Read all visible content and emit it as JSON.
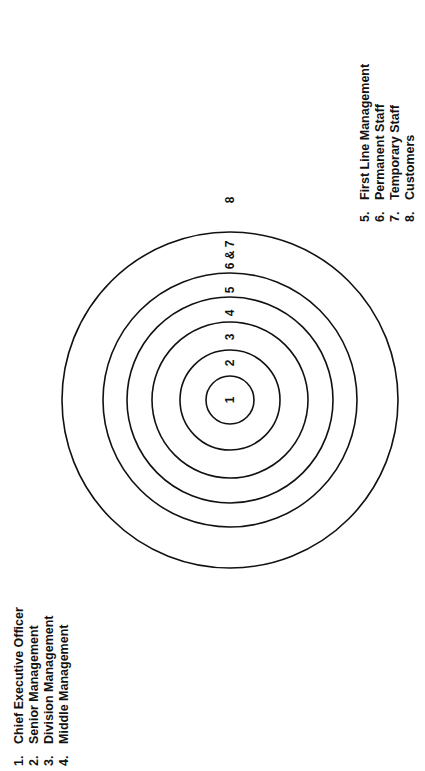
{
  "diagram": {
    "center": {
      "x": 230,
      "y": 400
    },
    "rings": [
      {
        "id": 1,
        "radius": 24
      },
      {
        "id": 2,
        "radius": 50
      },
      {
        "id": 3,
        "radius": 78
      },
      {
        "id": 4,
        "radius": 103
      },
      {
        "id": 5,
        "radius": 127
      },
      {
        "id": 6,
        "radius": 168
      }
    ],
    "ring_labels": [
      {
        "text": "1",
        "y": 400
      },
      {
        "text": "2",
        "y": 363
      },
      {
        "text": "3",
        "y": 337
      },
      {
        "text": "4",
        "y": 313
      },
      {
        "text": "5",
        "y": 290
      },
      {
        "text": "6 & 7",
        "y": 255
      },
      {
        "text": "8",
        "y": 200
      }
    ]
  },
  "legend_left": {
    "items": [
      {
        "num": "1.",
        "label": "Chief Executive Officer"
      },
      {
        "num": "2.",
        "label": "Senior Management"
      },
      {
        "num": "3.",
        "label": "Division Management"
      },
      {
        "num": "4.",
        "label": "Middle Management"
      }
    ]
  },
  "legend_right": {
    "items": [
      {
        "num": "5.",
        "label": "First Line Management"
      },
      {
        "num": "6.",
        "label": "Permanent Staff"
      },
      {
        "num": "7.",
        "label": "Temporary Staff"
      },
      {
        "num": "8.",
        "label": "Customers"
      }
    ]
  }
}
